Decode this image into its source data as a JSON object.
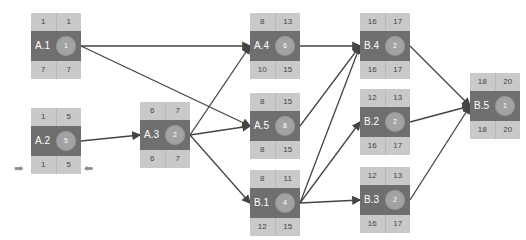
{
  "colors": {
    "band_light": "#c9c9c9",
    "band_dark": "#6f6f6f",
    "circle": "#a3a3a3",
    "edge": "#444444"
  },
  "nodes": [
    {
      "id": "A.1",
      "es": "1",
      "ef": "1",
      "ls": "7",
      "lf": "7",
      "duration": "1",
      "x": 31,
      "y": 13
    },
    {
      "id": "A.2",
      "es": "1",
      "ef": "5",
      "ls": "1",
      "lf": "5",
      "duration": "5",
      "x": 31,
      "y": 108
    },
    {
      "id": "A.3",
      "es": "6",
      "ef": "7",
      "ls": "6",
      "lf": "7",
      "duration": "2",
      "x": 140,
      "y": 102
    },
    {
      "id": "A.4",
      "es": "8",
      "ef": "13",
      "ls": "10",
      "lf": "15",
      "duration": "6",
      "x": 250,
      "y": 13
    },
    {
      "id": "A.5",
      "es": "8",
      "ef": "15",
      "ls": "8",
      "lf": "15",
      "duration": "8",
      "x": 250,
      "y": 93
    },
    {
      "id": "B.1",
      "es": "8",
      "ef": "11",
      "ls": "12",
      "lf": "15",
      "duration": "4",
      "x": 250,
      "y": 170
    },
    {
      "id": "B.4",
      "es": "16",
      "ef": "17",
      "ls": "16",
      "lf": "17",
      "duration": "2",
      "x": 360,
      "y": 13
    },
    {
      "id": "B.2",
      "es": "12",
      "ef": "13",
      "ls": "16",
      "lf": "17",
      "duration": "2",
      "x": 360,
      "y": 89
    },
    {
      "id": "B.3",
      "es": "12",
      "ef": "13",
      "ls": "16",
      "lf": "17",
      "duration": "2",
      "x": 360,
      "y": 167
    },
    {
      "id": "B.5",
      "es": "18",
      "ef": "20",
      "ls": "18",
      "lf": "20",
      "duration": "1",
      "x": 470,
      "y": 73
    }
  ],
  "edges": [
    {
      "from": "A.1",
      "to": "A.4"
    },
    {
      "from": "A.1",
      "to": "A.5"
    },
    {
      "from": "A.2",
      "to": "A.3"
    },
    {
      "from": "A.3",
      "to": "A.4"
    },
    {
      "from": "A.3",
      "to": "A.5"
    },
    {
      "from": "A.3",
      "to": "B.1"
    },
    {
      "from": "A.4",
      "to": "B.4"
    },
    {
      "from": "A.5",
      "to": "B.4"
    },
    {
      "from": "B.1",
      "to": "B.4"
    },
    {
      "from": "B.1",
      "to": "B.2"
    },
    {
      "from": "B.1",
      "to": "B.3"
    },
    {
      "from": "B.4",
      "to": "B.5"
    },
    {
      "from": "B.2",
      "to": "B.5"
    },
    {
      "from": "B.3",
      "to": "B.5"
    }
  ],
  "markers": {
    "left_arrow": "➡",
    "right_arrow": "⬅"
  }
}
